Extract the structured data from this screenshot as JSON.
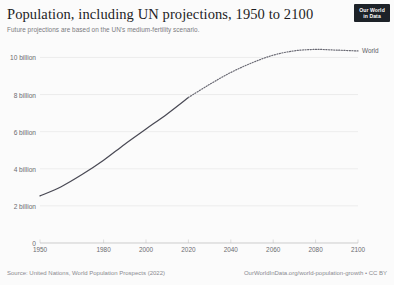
{
  "header": {
    "title": "Population, including UN projections, 1950 to 2100",
    "subtitle": "Future projections are based on the UN's medium-fertility scenario."
  },
  "logo": {
    "line1": "Our World",
    "line2": "in Data",
    "background": "#1d2228",
    "text_color": "#ffffff"
  },
  "footer": {
    "source": "Source: United Nations, World Population Prospects (2022)",
    "license": "OurWorldInData.org/world-population-growth • CC BY"
  },
  "colors": {
    "series": "#4a4a55",
    "projection": "#6a6a74",
    "gridline": "#e3e3e3",
    "axis": "#b9b9b9",
    "label": "#6b6b70",
    "background": "#fbfbfb"
  },
  "chart_data": {
    "type": "line",
    "title": "Population, including UN projections, 1950 to 2100",
    "subtitle": "Future projections are based on the UN's medium-fertility scenario.",
    "xlabel": "",
    "ylabel": "",
    "grid": true,
    "legend_position": "right-inline",
    "xlim": [
      1950,
      2100
    ],
    "ylim": [
      0,
      10400000000
    ],
    "xticks": [
      1950,
      1980,
      2000,
      2020,
      2040,
      2060,
      2080,
      2100
    ],
    "xticklabels": [
      "1950",
      "1980",
      "2000",
      "2020",
      "2040",
      "2060",
      "2080",
      "2100"
    ],
    "yticks": [
      0,
      2000000000,
      4000000000,
      6000000000,
      8000000000,
      10000000000
    ],
    "yticklabels": [
      "0",
      "2 billion",
      "4 billion",
      "6 billion",
      "8 billion",
      "10 billion"
    ],
    "projection_start_year": 2020,
    "series": [
      {
        "name": "World",
        "label": "World",
        "x": [
          1950,
          1960,
          1970,
          1980,
          1990,
          2000,
          2010,
          2020,
          2030,
          2040,
          2050,
          2060,
          2070,
          2080,
          2090,
          2100
        ],
        "values": [
          2536000000,
          3034000000,
          3700000000,
          4458000000,
          5327000000,
          6143000000,
          6956000000,
          7841000000,
          8546000000,
          9188000000,
          9709000000,
          10121000000,
          10356000000,
          10431000000,
          10394000000,
          10349000000
        ],
        "annotations": [
          "Solid line: historical estimates 1950-2020",
          "Dotted line: UN medium-fertility projection 2020-2100"
        ]
      }
    ]
  }
}
